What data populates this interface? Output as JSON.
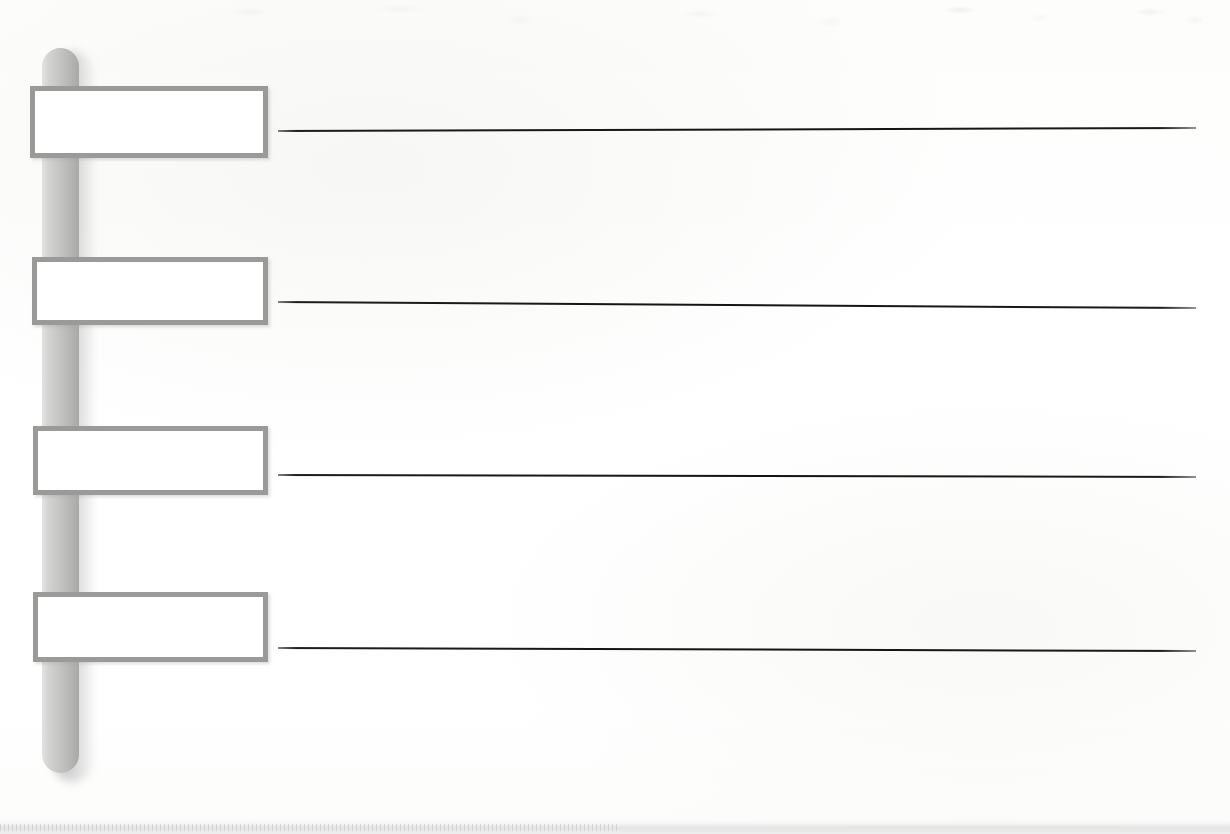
{
  "document": {
    "type": "scanned-worksheet",
    "title": "",
    "page_width": 1230,
    "page_height": 834,
    "background_color": "#ffffff"
  },
  "pole": {
    "name": "vertical-timeline-bar",
    "x": 42,
    "y": 48,
    "width": 37,
    "height": 725,
    "corner_radius": 19,
    "fill_light": "#e3e3e1",
    "fill_dark": "#a9a9a7",
    "shadow_color": "#969696",
    "label": ""
  },
  "boxes": [
    {
      "index": 1,
      "label": "",
      "x": 30,
      "y": 86,
      "width": 238,
      "height": 72,
      "border_color": "#9a9a98",
      "fill": "#ffffff"
    },
    {
      "index": 2,
      "label": "",
      "x": 32,
      "y": 257,
      "width": 236,
      "height": 68,
      "border_color": "#9a9a98",
      "fill": "#ffffff"
    },
    {
      "index": 3,
      "label": "",
      "x": 33,
      "y": 426,
      "width": 235,
      "height": 69,
      "border_color": "#9a9a98",
      "fill": "#ffffff"
    },
    {
      "index": 4,
      "label": "",
      "x": 33,
      "y": 592,
      "width": 235,
      "height": 70,
      "border_color": "#9a9a98",
      "fill": "#ffffff"
    }
  ],
  "rules": [
    {
      "index": 1,
      "text": "",
      "x": 278,
      "y": 130,
      "length": 918,
      "angle_deg": -0.19,
      "color": "#141414"
    },
    {
      "index": 2,
      "text": "",
      "x": 278,
      "y": 301,
      "length": 918,
      "angle_deg": 0.38,
      "color": "#141414"
    },
    {
      "index": 3,
      "text": "",
      "x": 278,
      "y": 474,
      "length": 918,
      "angle_deg": 0.12,
      "color": "#141414"
    },
    {
      "index": 4,
      "text": "",
      "x": 278,
      "y": 647,
      "length": 918,
      "angle_deg": 0.19,
      "color": "#141414"
    }
  ],
  "artifacts": {
    "bottom_scan_edge_label": "",
    "top_bleedthrough_label": ""
  }
}
